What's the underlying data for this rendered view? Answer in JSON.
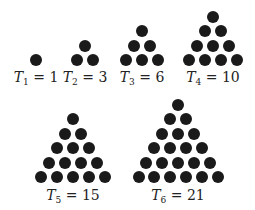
{
  "figure": {
    "dot_color": "#1a1a1a",
    "numbers": [
      {
        "symbol": "T",
        "index": "1",
        "eq": " = ",
        "value": "1",
        "rows": 1,
        "cx": 36,
        "bottom_y": 60,
        "label_y": 70
      },
      {
        "symbol": "T",
        "index": "2",
        "eq": " = ",
        "value": "3",
        "rows": 2,
        "cx": 85,
        "bottom_y": 60,
        "label_y": 70
      },
      {
        "symbol": "T",
        "index": "3",
        "eq": " = ",
        "value": "6",
        "rows": 3,
        "cx": 142,
        "bottom_y": 60,
        "label_y": 70
      },
      {
        "symbol": "T",
        "index": "4",
        "eq": " = ",
        "value": "10",
        "rows": 4,
        "cx": 213,
        "bottom_y": 60,
        "label_y": 70
      },
      {
        "symbol": "T",
        "index": "5",
        "eq": " = ",
        "value": "15",
        "rows": 5,
        "cx": 73,
        "bottom_y": 177,
        "label_y": 188
      },
      {
        "symbol": "T",
        "index": "6",
        "eq": " = ",
        "value": "21",
        "rows": 6,
        "cx": 178,
        "bottom_y": 177,
        "label_y": 188
      }
    ]
  }
}
